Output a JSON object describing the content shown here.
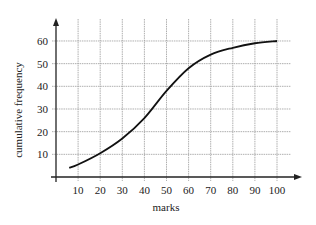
{
  "chart_data": {
    "type": "line",
    "title": "",
    "xlabel": "marks",
    "ylabel": "cumulative frequency",
    "x": [
      6,
      10,
      20,
      30,
      40,
      50,
      60,
      70,
      80,
      90,
      100
    ],
    "series": [
      {
        "name": "cumulative frequency",
        "values": [
          4,
          5.5,
          10.5,
          17,
          26,
          38,
          48,
          54,
          57,
          59,
          60
        ]
      }
    ],
    "xticks": [
      "10",
      "20",
      "30",
      "40",
      "50",
      "60",
      "70",
      "80",
      "90",
      "100"
    ],
    "yticks": [
      "10",
      "20",
      "30",
      "40",
      "50",
      "60"
    ],
    "xlim": [
      0,
      110
    ],
    "ylim": [
      0,
      65
    ],
    "grid": true,
    "legend": "none",
    "colors": {
      "line": "#111111",
      "grid": "#9a9a9a",
      "axis": "#222222"
    }
  }
}
